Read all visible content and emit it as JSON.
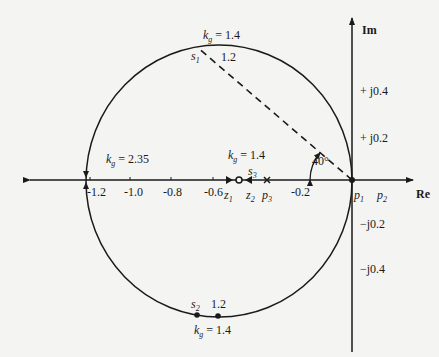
{
  "diagram": {
    "type": "root-locus",
    "axes": {
      "real_label": "Re",
      "imag_label": "Im",
      "real_ticks": [
        "-1.2",
        "-1.0",
        "-0.8",
        "-0.6",
        "-0.2"
      ],
      "imag_ticks_pos": [
        "+ j0.4",
        "+ j0.2"
      ],
      "imag_ticks_neg": [
        "−j0.2",
        "−j0.4"
      ]
    },
    "points": {
      "p1": {
        "base": "p",
        "sub": "1"
      },
      "p2": {
        "base": "p",
        "sub": "2"
      },
      "p3": {
        "base": "p",
        "sub": "3"
      },
      "z1": {
        "base": "z",
        "sub": "1"
      },
      "z2": {
        "base": "z",
        "sub": "2"
      },
      "s1": {
        "base": "s",
        "sub": "1"
      },
      "s2": {
        "base": "s",
        "sub": "2"
      },
      "s3": {
        "base": "s",
        "sub": "3"
      }
    },
    "gain_labels": {
      "top": {
        "k": "k",
        "sub": "g",
        "value": " = 1.4"
      },
      "top_alt": "1.2",
      "left": {
        "k": "k",
        "sub": "g",
        "value": " = 2.35"
      },
      "axis": {
        "k": "k",
        "sub": "g",
        "value": " = 1.4"
      },
      "bottom": {
        "k": "k",
        "sub": "g",
        "value": " = 1.4"
      },
      "bottom_alt": "1.2"
    },
    "angle_label": "40°",
    "colors": {
      "line": "#1a1a1a",
      "background": "#f4f4f2"
    }
  }
}
